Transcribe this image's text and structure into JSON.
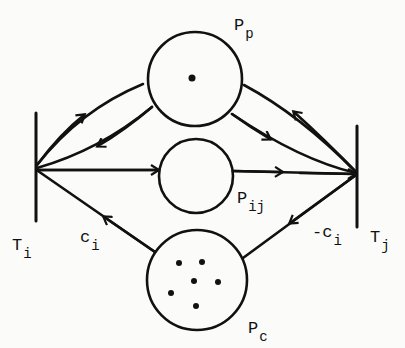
{
  "diagram": {
    "type": "petri-net",
    "places": [
      {
        "id": "P_p",
        "label": "P",
        "subscript": "p",
        "tokens": 1
      },
      {
        "id": "P_ij",
        "label": "P",
        "subscript": "ij",
        "tokens": 0
      },
      {
        "id": "P_c",
        "label": "P",
        "subscript": "c",
        "tokens": 6
      }
    ],
    "transitions": [
      {
        "id": "T_i",
        "label": "T",
        "subscript": "i"
      },
      {
        "id": "T_j",
        "label": "T",
        "subscript": "j"
      }
    ],
    "arc_labels": [
      {
        "id": "c_i",
        "label": "c",
        "subscript": "i"
      },
      {
        "id": "neg_c_i",
        "label": "-c",
        "subscript": "i"
      }
    ],
    "arcs": [
      {
        "from": "T_i",
        "to": "P_p"
      },
      {
        "from": "P_p",
        "to": "T_i"
      },
      {
        "from": "T_i",
        "to": "P_ij"
      },
      {
        "from": "P_c",
        "to": "T_i",
        "label": "c_i"
      },
      {
        "from": "T_j",
        "to": "P_p"
      },
      {
        "from": "P_p",
        "to": "T_j"
      },
      {
        "from": "P_ij",
        "to": "T_j"
      },
      {
        "from": "T_j",
        "to": "P_c",
        "label": "-c_i"
      }
    ],
    "colors": {
      "ink": "#111111",
      "paper": "#fbfbfa"
    }
  }
}
